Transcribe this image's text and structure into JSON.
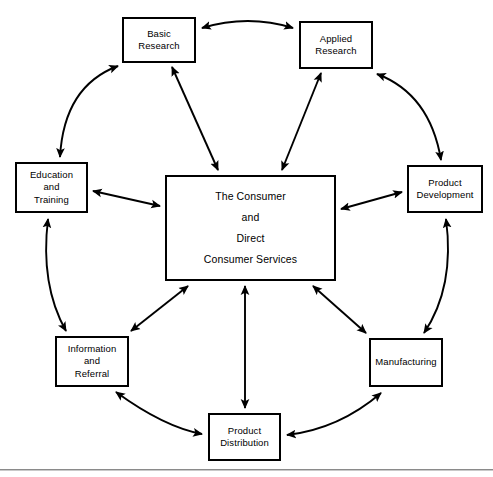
{
  "diagram": {
    "line_color": "#000000",
    "box_fill": "#ffffff",
    "rule_color": "#8a8a8a",
    "nodes": [
      {
        "id": "basic-research",
        "label": "Basic Research",
        "lines": [
          "Basic",
          "Research"
        ],
        "x": 122,
        "y": 17,
        "w": 74,
        "h": 46
      },
      {
        "id": "applied-research",
        "label": "Applied Research",
        "lines": [
          "Applied",
          "Research"
        ],
        "x": 299,
        "y": 21,
        "w": 74,
        "h": 48
      },
      {
        "id": "education-and-training",
        "label": "Education and Training",
        "lines": [
          "Education",
          "and",
          "Training"
        ],
        "x": 15,
        "y": 162,
        "w": 73,
        "h": 51
      },
      {
        "id": "product-development",
        "label": "Product Development",
        "lines": [
          "Product",
          "Development"
        ],
        "x": 407,
        "y": 165,
        "w": 76,
        "h": 48
      },
      {
        "id": "the-consumer",
        "label": "The Consumer and Direct Consumer Services",
        "lines": [
          "The Consumer",
          "and",
          "Direct",
          "Consumer Services"
        ],
        "x": 165,
        "y": 175,
        "w": 171,
        "h": 106
      },
      {
        "id": "information-and-referral",
        "label": "Information and Referral",
        "lines": [
          "Information",
          "and",
          "Referral"
        ],
        "x": 55,
        "y": 336,
        "w": 74,
        "h": 51
      },
      {
        "id": "manufacturing",
        "label": "Manufacturing",
        "lines": [
          "Manufacturing"
        ],
        "x": 369,
        "y": 338,
        "w": 74,
        "h": 49
      },
      {
        "id": "product-distribution",
        "label": "Product Distribution",
        "lines": [
          "Product",
          "Distribution"
        ],
        "x": 208,
        "y": 413,
        "w": 73,
        "h": 48
      }
    ],
    "connections": [
      {
        "id": "basic-research--applied-research",
        "from": "basic-research",
        "to": "applied-research",
        "style": "curved",
        "heads": "both"
      },
      {
        "id": "education-and-training--basic-research",
        "from": "education-and-training",
        "to": "basic-research",
        "style": "curved",
        "heads": "both"
      },
      {
        "id": "applied-research--product-development",
        "from": "applied-research",
        "to": "product-development",
        "style": "curved",
        "heads": "both"
      },
      {
        "id": "education-and-training--information-and-referral",
        "from": "education-and-training",
        "to": "information-and-referral",
        "style": "curved",
        "heads": "both"
      },
      {
        "id": "product-development--manufacturing",
        "from": "product-development",
        "to": "manufacturing",
        "style": "curved",
        "heads": "both"
      },
      {
        "id": "information-and-referral--product-distribution",
        "from": "information-and-referral",
        "to": "product-distribution",
        "style": "curved",
        "heads": "both"
      },
      {
        "id": "manufacturing--product-distribution",
        "from": "manufacturing",
        "to": "product-distribution",
        "style": "curved",
        "heads": "both"
      },
      {
        "id": "basic-research--the-consumer",
        "from": "basic-research",
        "to": "the-consumer",
        "style": "straight",
        "heads": "both"
      },
      {
        "id": "applied-research--the-consumer",
        "from": "applied-research",
        "to": "the-consumer",
        "style": "straight",
        "heads": "both"
      },
      {
        "id": "education-and-training--the-consumer",
        "from": "education-and-training",
        "to": "the-consumer",
        "style": "straight",
        "heads": "both"
      },
      {
        "id": "product-development--the-consumer",
        "from": "product-development",
        "to": "the-consumer",
        "style": "straight",
        "heads": "both"
      },
      {
        "id": "information-and-referral--the-consumer",
        "from": "information-and-referral",
        "to": "the-consumer",
        "style": "straight",
        "heads": "both"
      },
      {
        "id": "manufacturing--the-consumer",
        "from": "manufacturing",
        "to": "the-consumer",
        "style": "straight",
        "heads": "both"
      },
      {
        "id": "product-distribution--the-consumer",
        "from": "product-distribution",
        "to": "the-consumer",
        "style": "straight",
        "heads": "both"
      }
    ]
  }
}
